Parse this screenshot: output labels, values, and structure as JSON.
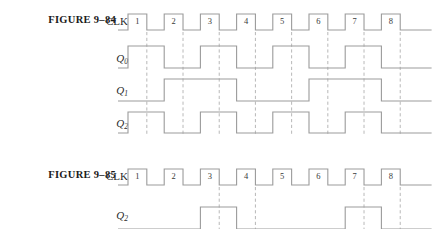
{
  "figures": [
    {
      "id": "9-84",
      "label": "FIGURE 9–84",
      "clock": {
        "label": "CLK",
        "pulse_numbers": [
          "1",
          "2",
          "3",
          "4",
          "5",
          "6",
          "7",
          "8"
        ],
        "periods": 8
      },
      "signals": [
        {
          "name": "Q",
          "subscript": "0",
          "description": "toggles every clock period, divide-by-2",
          "pattern": [
            1,
            0,
            1,
            0,
            1,
            0,
            1,
            0
          ]
        },
        {
          "name": "Q",
          "subscript": "1",
          "description": "toggles every two clock periods, divide-by-4",
          "pattern": [
            0,
            1,
            1,
            0,
            0,
            1,
            1,
            0
          ]
        },
        {
          "name": "Q",
          "subscript": "2",
          "description": "toggles every clock period, in phase with Q0",
          "pattern": [
            1,
            0,
            1,
            0,
            1,
            0,
            1,
            0
          ]
        }
      ],
      "gridline_count": 8
    },
    {
      "id": "9-85",
      "label": "FIGURE 9–85",
      "clock": {
        "label": "CLK",
        "pulse_numbers": [
          "1",
          "2",
          "3",
          "4",
          "5",
          "6",
          "7",
          "8"
        ],
        "periods": 8
      },
      "signals": [
        {
          "name": "Q",
          "subscript": "2",
          "description": "high during clock periods 3 and 7",
          "pattern": [
            0,
            0,
            1,
            0,
            0,
            0,
            1,
            0
          ]
        }
      ],
      "gridline_marks": [
        3,
        4,
        7,
        8
      ]
    }
  ],
  "colors": {
    "waveform": "#9b9b9b",
    "gridline": "#b0b0b0",
    "label_text": "#1a1a1a",
    "signal_text": "#2b2b2b",
    "pulse_number": "#3a3a3a",
    "background": "#ffffff"
  }
}
